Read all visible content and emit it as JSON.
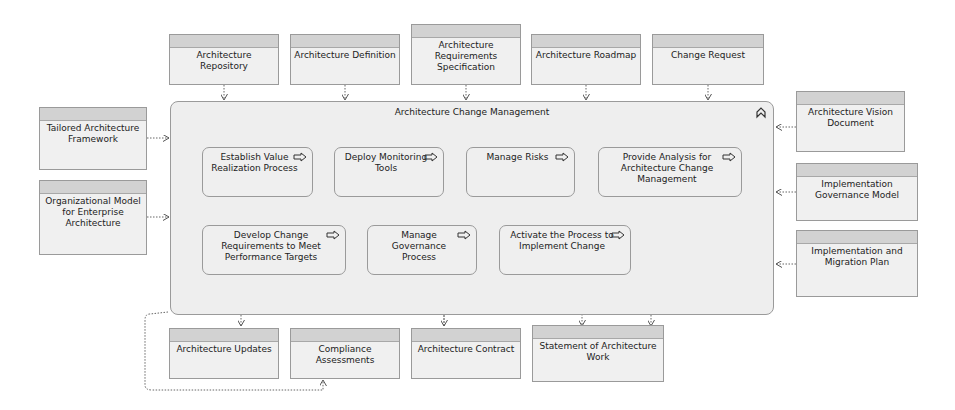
{
  "container": {
    "title": "Architecture Change Management",
    "collapse_icon": "collapse-chevron-icon"
  },
  "processes": [
    {
      "label": "Establish Value Realization Process"
    },
    {
      "label": "Deploy Monitoring Tools"
    },
    {
      "label": "Manage Risks"
    },
    {
      "label": "Provide Analysis for Architecture Change Management"
    },
    {
      "label": "Develop Change Requirements to Meet Performance Targets"
    },
    {
      "label": "Manage Governance Process"
    },
    {
      "label": "Activate the Process to Implement Change"
    }
  ],
  "inputs_top": [
    {
      "label": "Architecture Repository"
    },
    {
      "label": "Architecture Definition"
    },
    {
      "label": "Architecture Requirements Specification"
    },
    {
      "label": "Architecture Roadmap"
    },
    {
      "label": "Change Request"
    }
  ],
  "inputs_left": [
    {
      "label": "Tailored Architecture Framework"
    },
    {
      "label": "Organizational Model for Enterprise Architecture"
    }
  ],
  "inputs_right": [
    {
      "label": "Architecture Vision Document"
    },
    {
      "label": "Implementation Governance Model"
    },
    {
      "label": "Implementation and Migration Plan"
    }
  ],
  "outputs_bottom": [
    {
      "label": "Architecture Updates"
    },
    {
      "label": "Compliance Assessments"
    },
    {
      "label": "Architecture Contract"
    },
    {
      "label": "Statement of Architecture Work"
    }
  ],
  "colors": {
    "object_fill": "#f0f0f0",
    "object_header": "#d2d2d2",
    "border": "#9a9a9a",
    "flow_line": "#333333",
    "dotted_line": "#777777"
  }
}
